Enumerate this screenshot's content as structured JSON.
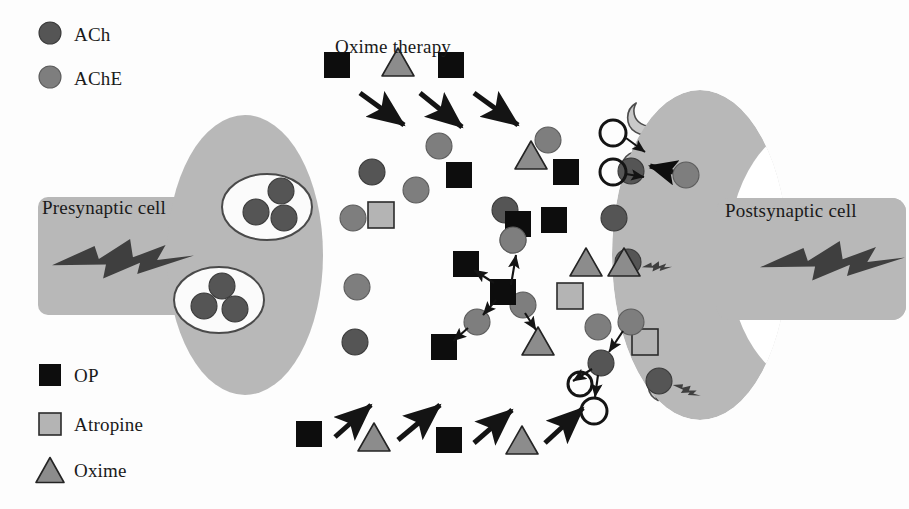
{
  "figure": {
    "background_color": "#fdfdfd"
  },
  "colors": {
    "cell_body": "#b8b8b8",
    "cell_body_edge": "#ababab",
    "ach": "#555555",
    "ach_edge": "#3a3a3a",
    "ache": "#7e7e7e",
    "ache_edge": "#5c5c5c",
    "op": "#0d0d0d",
    "atropine_fill": "#b4b4b4",
    "atropine_edge": "#2b2b2b",
    "oxime_fill": "#8c8c8c",
    "oxime_edge": "#242424",
    "vesicle_fill": "#fbfbfb",
    "vesicle_edge": "#4a4a4a",
    "receptor_fill": "#c9c9c9",
    "receptor_edge": "#4d4d4d",
    "arrow": "#141414",
    "hollow_ring": "#141414",
    "bolt": "#3f3f3f",
    "text": "#1a1a1a"
  },
  "legend_top": {
    "name": "molecule-legend",
    "items": [
      {
        "label": "ACh",
        "glyph": "circle",
        "fill": "#555555",
        "x": 50,
        "y": 33
      },
      {
        "label": "AChE",
        "glyph": "circle",
        "fill": "#7e7e7e",
        "x": 50,
        "y": 77
      }
    ]
  },
  "legend_bottom": {
    "name": "drug-legend",
    "items": [
      {
        "label": "OP",
        "glyph": "square",
        "fill": "#0d0d0d",
        "x": 50,
        "y": 375
      },
      {
        "label": "Atropine",
        "glyph": "square",
        "fill": "#b4b4b4",
        "x": 50,
        "y": 424
      },
      {
        "label": "Oxime",
        "glyph": "triangle",
        "fill": "#8c8c8c",
        "x": 50,
        "y": 470
      }
    ]
  },
  "labels": {
    "presynaptic": "Presynaptic cell",
    "postsynaptic": "Postsynaptic cell",
    "oxime_therapy": "Oxime therapy"
  },
  "presynaptic_cell": {
    "name": "presynaptic-cell",
    "soma": {
      "cx": 245,
      "cy": 255,
      "rx": 78,
      "ry": 140
    },
    "axon": {
      "x": 38,
      "y": 197,
      "w": 175,
      "h": 118
    },
    "bolt": {
      "x": 52,
      "y": 238,
      "w": 142,
      "h": 44
    },
    "vesicles": [
      {
        "cx": 267,
        "cy": 207,
        "rx": 45,
        "ry": 33,
        "contents": [
          {
            "cx": 281,
            "cy": 191,
            "r": 13
          },
          {
            "cx": 256,
            "cy": 212,
            "r": 13
          },
          {
            "cx": 284,
            "cy": 218,
            "r": 13
          }
        ]
      },
      {
        "cx": 219,
        "cy": 300,
        "rx": 45,
        "ry": 33,
        "contents": [
          {
            "cx": 222,
            "cy": 286,
            "r": 13
          },
          {
            "cx": 204,
            "cy": 306,
            "r": 13
          },
          {
            "cx": 235,
            "cy": 309,
            "r": 13
          }
        ]
      }
    ]
  },
  "postsynaptic_cell": {
    "name": "postsynaptic-cell",
    "crescent": {
      "cx": 700,
      "cy": 255,
      "rx": 88,
      "ry": 165
    },
    "axon": {
      "x": 716,
      "y": 198,
      "w": 190,
      "h": 122
    },
    "bolt": {
      "x": 760,
      "y": 240,
      "w": 145,
      "h": 44
    },
    "receptors": [
      {
        "cx": 642,
        "cy": 122,
        "rot": -58,
        "occupant": "none"
      },
      {
        "cx": 634,
        "cy": 171,
        "rot": -30,
        "occupant": "ach",
        "signal": false
      },
      {
        "cx": 628,
        "cy": 218,
        "rot": -10,
        "occupant": "none"
      },
      {
        "cx": 631,
        "cy": 262,
        "rot": 8,
        "occupant": "ach",
        "signal": true
      },
      {
        "cx": 638,
        "cy": 305,
        "rot": 22,
        "occupant": "none"
      },
      {
        "cx": 651,
        "cy": 342,
        "rot": 38,
        "occupant": "atropine",
        "signal": false
      },
      {
        "cx": 662,
        "cy": 381,
        "rot": 52,
        "occupant": "ach",
        "signal": true
      }
    ]
  },
  "cleft_particles": [
    {
      "type": "ache",
      "cx": 353,
      "cy": 218
    },
    {
      "type": "ach",
      "cx": 372,
      "cy": 172
    },
    {
      "type": "ache",
      "cx": 416,
      "cy": 190
    },
    {
      "type": "ache",
      "cx": 439,
      "cy": 146
    },
    {
      "type": "op",
      "cx": 459,
      "cy": 175
    },
    {
      "type": "atropine",
      "cx": 381,
      "cy": 215
    },
    {
      "type": "ache",
      "cx": 357,
      "cy": 287
    },
    {
      "type": "ach",
      "cx": 355,
      "cy": 342
    },
    {
      "type": "ach",
      "cx": 505,
      "cy": 210
    },
    {
      "type": "ache",
      "cx": 513,
      "cy": 240
    },
    {
      "type": "op",
      "cx": 518,
      "cy": 224
    },
    {
      "type": "oxime",
      "cx": 531,
      "cy": 155
    },
    {
      "type": "ache",
      "cx": 548,
      "cy": 140
    },
    {
      "type": "op",
      "cx": 566,
      "cy": 172
    },
    {
      "type": "op",
      "cx": 554,
      "cy": 220
    },
    {
      "type": "oxime",
      "cx": 586,
      "cy": 262
    },
    {
      "type": "oxime",
      "cx": 624,
      "cy": 262
    },
    {
      "type": "atropine",
      "cx": 570,
      "cy": 296
    },
    {
      "type": "ach",
      "cx": 614,
      "cy": 218
    },
    {
      "type": "ache",
      "cx": 631,
      "cy": 322
    },
    {
      "type": "ache",
      "cx": 598,
      "cy": 327
    },
    {
      "type": "ach",
      "cx": 601,
      "cy": 363
    }
  ],
  "reaction_cluster": {
    "name": "op-ache-inhibition-cluster",
    "central_op": {
      "cx": 503,
      "cy": 292
    },
    "bound_ache": {
      "cx": 523,
      "cy": 305
    },
    "satellites": [
      {
        "type": "op",
        "cx": 466,
        "cy": 264
      },
      {
        "type": "ache",
        "cx": 477,
        "cy": 322
      },
      {
        "type": "op",
        "cx": 444,
        "cy": 347
      },
      {
        "type": "oxime",
        "cx": 538,
        "cy": 341
      },
      {
        "type": "ache",
        "cx": 513,
        "cy": 240
      }
    ],
    "arrows": [
      {
        "x1": 494,
        "y1": 283,
        "x2": 474,
        "y2": 270
      },
      {
        "x1": 496,
        "y1": 300,
        "x2": 483,
        "y2": 315
      },
      {
        "x1": 468,
        "y1": 328,
        "x2": 453,
        "y2": 341
      },
      {
        "x1": 511,
        "y1": 285,
        "x2": 516,
        "y2": 255
      },
      {
        "x1": 525,
        "y1": 313,
        "x2": 536,
        "y2": 330
      }
    ]
  },
  "hydrolysis": {
    "name": "ach-hydrolysis",
    "ache_source": {
      "cx": 631,
      "cy": 322
    },
    "ach_target": {
      "cx": 601,
      "cy": 363
    },
    "products": [
      {
        "cx": 580,
        "cy": 384,
        "r": 12
      },
      {
        "cx": 594,
        "cy": 411,
        "r": 13
      }
    ],
    "arrows": [
      {
        "x1": 623,
        "y1": 331,
        "x2": 609,
        "y2": 352
      },
      {
        "x1": 592,
        "y1": 369,
        "x2": 573,
        "y2": 381
      },
      {
        "x1": 598,
        "y1": 375,
        "x2": 595,
        "y2": 397
      }
    ]
  },
  "receptor_hydrolysis": {
    "name": "receptor-ach-hydrolysis",
    "products": [
      {
        "cx": 613,
        "cy": 133,
        "r": 13
      },
      {
        "cx": 613,
        "cy": 172,
        "r": 13
      }
    ],
    "arrows": [
      {
        "x1": 626,
        "y1": 138,
        "x2": 645,
        "y2": 152
      },
      {
        "x1": 626,
        "y1": 174,
        "x2": 644,
        "y2": 177
      }
    ],
    "ache_enzyme": {
      "cx": 686,
      "cy": 175
    },
    "bold_arrow": {
      "x1": 673,
      "y1": 172,
      "x2": 650,
      "y2": 166
    }
  },
  "top_therapy_row": {
    "name": "oxime-therapy-inflow",
    "label_x": 335,
    "label_y": 48,
    "items": [
      {
        "type": "op",
        "x": 337,
        "y": 65,
        "arrow": {
          "x1": 360,
          "y1": 93,
          "x2": 404,
          "y2": 125
        }
      },
      {
        "type": "oxime",
        "x": 398,
        "y": 62,
        "arrow": {
          "x1": 420,
          "y1": 93,
          "x2": 462,
          "y2": 127
        }
      },
      {
        "type": "op",
        "x": 451,
        "y": 65,
        "arrow": {
          "x1": 474,
          "y1": 93,
          "x2": 518,
          "y2": 125
        }
      }
    ]
  },
  "bottom_therapy_row": {
    "name": "op-oxime-inflow",
    "items": [
      {
        "type": "op",
        "x": 309,
        "y": 434,
        "arrow": {
          "x1": 335,
          "y1": 437,
          "x2": 371,
          "y2": 405
        }
      },
      {
        "type": "oxime",
        "x": 374,
        "y": 437,
        "arrow": {
          "x1": 398,
          "y1": 440,
          "x2": 440,
          "y2": 405
        }
      },
      {
        "type": "op",
        "x": 449,
        "y": 440,
        "arrow": {
          "x1": 474,
          "y1": 443,
          "x2": 512,
          "y2": 410
        }
      },
      {
        "type": "oxime",
        "x": 522,
        "y": 440,
        "arrow": {
          "x1": 545,
          "y1": 443,
          "x2": 583,
          "y2": 408
        }
      }
    ]
  },
  "sizes": {
    "circle_r": 13,
    "square": 26,
    "triangle_w": 32,
    "triangle_h": 28,
    "legend_circle_r": 11,
    "legend_square": 22,
    "legend_triangle_w": 28
  }
}
